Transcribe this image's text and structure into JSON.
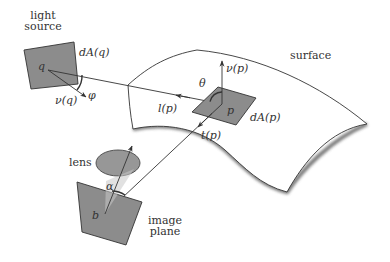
{
  "labels": {
    "light_source_line1": "light",
    "light_source_line2": "source",
    "dAq": "dA(q)",
    "q": "q",
    "phi": "φ",
    "nu_q": "ν(q)",
    "surface": "surface",
    "nu_p": "ν(p)",
    "theta": "θ",
    "l_p": "l(p)",
    "p": "p",
    "dAp": "dA(p)",
    "t_p": "t(p)",
    "lens": "lens",
    "alpha": "α",
    "b": "b",
    "image_plane_line1": "image",
    "image_plane_line2": "plane"
  },
  "colors": {
    "patch_fill": "#8c8c8c",
    "stroke": "#333333",
    "surface_shadow": "#555555",
    "background": "#ffffff"
  }
}
